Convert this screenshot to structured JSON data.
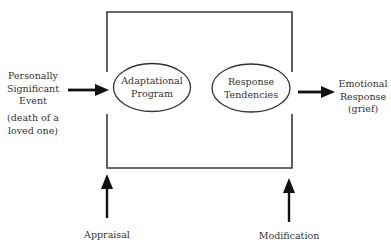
{
  "diagram": {
    "type": "process-model",
    "nodes": {
      "input": {
        "lines": [
          "Personally",
          "Significant",
          "Event"
        ],
        "note_lines": [
          "(death of a",
          "loved one)"
        ]
      },
      "adaptational_program": {
        "lines": [
          "Adaptational",
          "Program"
        ],
        "shape": "ellipse"
      },
      "response_tendencies": {
        "lines": [
          "Response",
          "Tendencies"
        ],
        "shape": "ellipse"
      },
      "output": {
        "lines": [
          "Emotional",
          "Response",
          "(grief)"
        ]
      },
      "appraisal": {
        "label": "Appraisal"
      },
      "modification": {
        "label": "Modification"
      }
    },
    "edges": [
      {
        "from": "input",
        "to": "adaptational_program"
      },
      {
        "from": "response_tendencies",
        "to": "output"
      },
      {
        "from": "appraisal",
        "to": "box-left-bottom"
      },
      {
        "from": "modification",
        "to": "box-right-bottom"
      }
    ],
    "colors": {
      "line": "#1a1a1a",
      "text": "#333333",
      "background": "#ffffff"
    }
  }
}
